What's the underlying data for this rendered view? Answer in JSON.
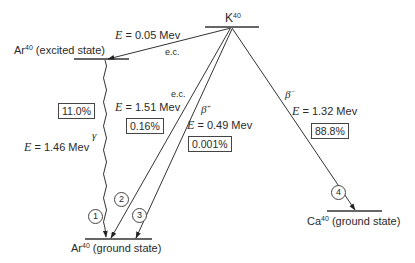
{
  "diagram": {
    "type": "nuclear decay scheme",
    "parent": {
      "symbol": "K",
      "mass": "40"
    },
    "levels": {
      "k40": {
        "element": "K",
        "mass": "40",
        "state": ""
      },
      "ar40_excited": {
        "element": "Ar",
        "mass": "40",
        "state": "(excited state)"
      },
      "ar40_ground": {
        "element": "Ar",
        "mass": "40",
        "state": "(ground state)"
      },
      "ca40_ground": {
        "element": "Ca",
        "mass": "40",
        "state": "(ground state)"
      }
    },
    "transitions": {
      "ec_excited": {
        "mode": "e.c.",
        "energy_prefix": "E",
        "energy": "= 0.05 Mev"
      },
      "gamma": {
        "mode": "γ",
        "energy_prefix": "E",
        "energy": "= 1.46 Mev",
        "branch": "11.0%",
        "number": "1"
      },
      "ec_ground": {
        "mode": "e.c.",
        "energy_prefix": "E",
        "energy": "= 1.51 Mev",
        "branch": "0.16%",
        "number": "2"
      },
      "beta_plus": {
        "mode": "β",
        "mode_sup": "+",
        "energy_prefix": "E",
        "energy": "= 0.49 Mev",
        "branch": "0.001%",
        "number": "3"
      },
      "beta_minus": {
        "mode": "β",
        "mode_sup": "−",
        "energy_prefix": "E",
        "energy": "= 1.32 Mev",
        "branch": "88.8%",
        "number": "4"
      }
    }
  }
}
